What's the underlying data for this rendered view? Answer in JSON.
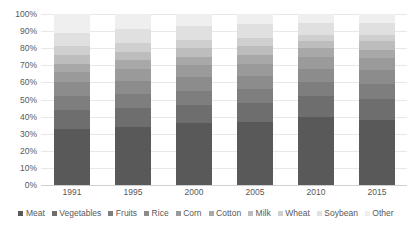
{
  "chart_data": {
    "type": "bar",
    "subtype": "100% stacked column",
    "title": "",
    "xlabel": "",
    "ylabel": "",
    "categories": [
      "1991",
      "1995",
      "2000",
      "2005",
      "2010",
      "2015"
    ],
    "ylim": [
      0,
      100
    ],
    "ytick_labels": [
      "100%",
      "90%",
      "80%",
      "70%",
      "60%",
      "50%",
      "40%",
      "30%",
      "20%",
      "10%",
      "0%"
    ],
    "ytick_values": [
      100,
      90,
      80,
      70,
      60,
      50,
      40,
      30,
      20,
      10,
      0
    ],
    "grid": true,
    "legend_position": "bottom",
    "units": "percent",
    "series": [
      {
        "name": "Meat",
        "color": "#595959",
        "values": [
          33,
          34,
          36,
          37,
          40,
          38
        ]
      },
      {
        "name": "Vegetables",
        "color": "#6e6e6e",
        "values": [
          11,
          11,
          11,
          11,
          12,
          12
        ]
      },
      {
        "name": "Fruits",
        "color": "#7e7e7e",
        "values": [
          8,
          8,
          8,
          8,
          8,
          9
        ]
      },
      {
        "name": "Rice",
        "color": "#8c8c8c",
        "values": [
          8,
          8,
          8,
          8,
          8,
          8
        ]
      },
      {
        "name": "Corn",
        "color": "#9a9a9a",
        "values": [
          6,
          7,
          7,
          7,
          7,
          7
        ]
      },
      {
        "name": "Cotton",
        "color": "#a8a8a8",
        "values": [
          5,
          5,
          5,
          5,
          5,
          5
        ]
      },
      {
        "name": "Milk",
        "color": "#bdbdbd",
        "values": [
          5,
          5,
          5,
          5,
          4,
          5
        ]
      },
      {
        "name": "Wheat",
        "color": "#cfcfcf",
        "values": [
          5,
          5,
          5,
          5,
          4,
          4
        ]
      },
      {
        "name": "Soybean",
        "color": "#e0e0e0",
        "values": [
          8,
          8,
          8,
          8,
          7,
          7
        ]
      },
      {
        "name": "Other",
        "color": "#efefef",
        "values": [
          11,
          9,
          7,
          6,
          5,
          5
        ]
      }
    ]
  },
  "legend": {
    "items": [
      {
        "label": "Meat"
      },
      {
        "label": "Vegetables"
      },
      {
        "label": "Fruits"
      },
      {
        "label": "Rice"
      },
      {
        "label": "Corn"
      },
      {
        "label": "Cotton"
      },
      {
        "label": "Milk"
      },
      {
        "label": "Wheat"
      },
      {
        "label": "Soybean"
      },
      {
        "label": "Other"
      }
    ]
  },
  "artifact": {
    "top_text": "   "
  }
}
